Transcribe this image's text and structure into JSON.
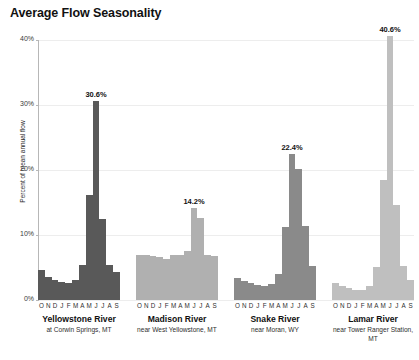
{
  "chart_data": {
    "type": "bar",
    "title": "Average Flow Seasonality",
    "xlabel": "",
    "ylabel": "Percent of mean annual flow",
    "ylim": [
      0,
      40
    ],
    "ytick_labels": [
      "0%",
      "10%",
      "20%",
      "30%",
      "40%"
    ],
    "ytick_values": [
      0,
      10,
      20,
      30,
      40
    ],
    "grid": true,
    "legend": "none",
    "categories": [
      "O",
      "N",
      "D",
      "J",
      "F",
      "M",
      "A",
      "M",
      "J",
      "J",
      "A",
      "S"
    ],
    "panels": [
      {
        "name": "Yellowstone River",
        "sublabel": "at Corwin Springs, MT",
        "color": "#595959",
        "peak_label": "30.6%",
        "peak_month": "J",
        "peak_index": 8,
        "values": [
          4.6,
          3.6,
          3.1,
          2.7,
          2.6,
          3.1,
          5.4,
          16.2,
          30.6,
          12.4,
          5.4,
          4.3
        ]
      },
      {
        "name": "Madison River",
        "sublabel": "near West Yellowstone, MT",
        "color": "#b0b0b0",
        "peak_label": "14.2%",
        "peak_month": "J",
        "peak_index": 8,
        "values": [
          7.0,
          6.9,
          6.8,
          6.6,
          6.3,
          7.0,
          6.9,
          7.5,
          14.2,
          12.6,
          7.0,
          6.8
        ]
      },
      {
        "name": "Snake River",
        "sublabel": "near Moran, WY",
        "color": "#8a8a8a",
        "peak_label": "22.4%",
        "peak_month": "J",
        "peak_index": 8,
        "values": [
          3.4,
          2.9,
          2.6,
          2.3,
          2.2,
          2.4,
          4.0,
          11.3,
          22.4,
          20.1,
          11.4,
          5.3
        ]
      },
      {
        "name": "Lamar River",
        "sublabel": "near Tower Ranger Station, MT",
        "color": "#bfbfbf",
        "peak_label": "40.6%",
        "peak_month": "J",
        "peak_index": 8,
        "values": [
          2.6,
          2.2,
          1.8,
          1.5,
          1.5,
          2.1,
          5.1,
          18.4,
          40.6,
          14.6,
          5.2,
          3.1
        ]
      }
    ]
  }
}
